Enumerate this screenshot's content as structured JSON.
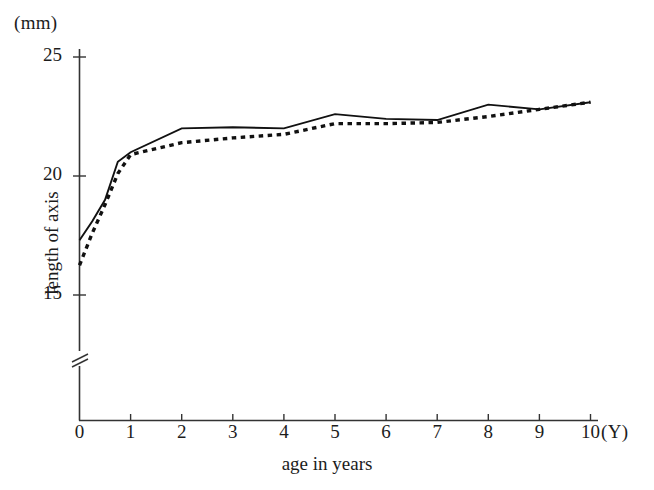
{
  "chart_data": {
    "type": "line",
    "title": "",
    "xlabel": "age in years",
    "ylabel": "length of axis",
    "x_unit": "(Y)",
    "y_unit": "(mm)",
    "xlim": [
      0,
      10
    ],
    "ylim": [
      13.8,
      25.6
    ],
    "xticks": [
      0,
      1,
      2,
      3,
      4,
      5,
      6,
      7,
      8,
      9,
      10
    ],
    "xticklabels": [
      "0",
      "1",
      "2",
      "3",
      "4",
      "5",
      "6",
      "7",
      "8",
      "9",
      "10"
    ],
    "yticks": [
      15,
      20,
      25
    ],
    "yticklabels": [
      "15",
      "20",
      "25"
    ],
    "grid": false,
    "legend": "none",
    "axis_break": {
      "axis": "y",
      "position": 14.3,
      "symbol": "double-slash"
    },
    "series": [
      {
        "name": "solid-curve",
        "style": "solid",
        "color": "#111111",
        "x": [
          0,
          0.25,
          0.5,
          0.75,
          1,
          2,
          3,
          4,
          5,
          6,
          7,
          8,
          9,
          10
        ],
        "values": [
          17.3,
          18.1,
          19.0,
          20.6,
          21.0,
          22.0,
          22.05,
          22.0,
          22.6,
          22.4,
          22.35,
          23.0,
          22.8,
          23.1
        ]
      },
      {
        "name": "dotted-curve",
        "style": "dotted",
        "color": "#111111",
        "x": [
          0,
          0.25,
          0.5,
          0.75,
          1,
          2,
          3,
          4,
          5,
          6,
          7,
          8,
          9,
          10
        ],
        "values": [
          16.25,
          17.6,
          18.8,
          20.1,
          20.9,
          21.4,
          21.6,
          21.75,
          22.2,
          22.2,
          22.25,
          22.5,
          22.8,
          23.1
        ]
      }
    ]
  },
  "axes": {
    "y_unit_label": "(mm)",
    "x_unit_label": "(Y)",
    "y_title": "length of axis",
    "x_title": "age in years"
  }
}
